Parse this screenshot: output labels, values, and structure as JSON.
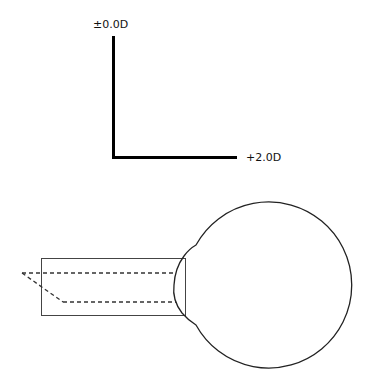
{
  "axes": {
    "vertical_label": "±0.0D",
    "horizontal_label": "+2.0D"
  },
  "diagram": {
    "stroke_color": "#222222",
    "axis_color": "#000000"
  }
}
